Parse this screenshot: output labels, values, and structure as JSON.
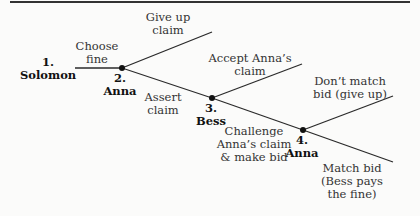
{
  "nodes": [
    {
      "num": "1.",
      "player": "Solomon"
    },
    {
      "num": "2.",
      "player": "Anna"
    },
    {
      "num": "3.",
      "player": "Bess"
    },
    {
      "num": "4.",
      "player": "Anna"
    }
  ],
  "edges": [
    {
      "line1": "Choose",
      "line2": "fine"
    },
    {
      "line1": "Give up",
      "line2": "claim"
    },
    {
      "line1": "Assert",
      "line2": "claim"
    },
    {
      "line1": "Accept Anna’s",
      "line2": "claim"
    },
    {
      "line1": "Challenge",
      "line2": "Anna’s claim",
      "line3": "& make bid"
    },
    {
      "line1": "Don’t match",
      "line2": "bid (give up)"
    },
    {
      "line1": "Match bid",
      "line2": "(Bess pays",
      "line3": "the fine)"
    }
  ],
  "colors": {
    "line": "#2a2a2a",
    "node_dot": "#111111",
    "rule": "#333333"
  }
}
